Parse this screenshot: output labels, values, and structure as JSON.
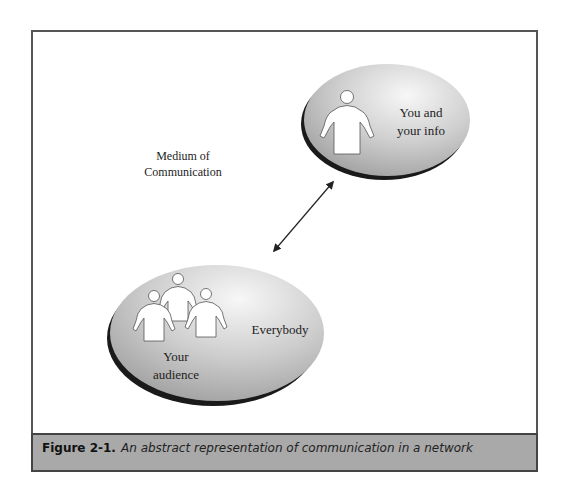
{
  "figure": {
    "number": "Figure 2-1.",
    "caption": "An abstract representation of communication in a network"
  },
  "nodes": {
    "self": {
      "line1": "You and",
      "line2": "your info",
      "icon": "person-icon"
    },
    "audience": {
      "group_label_line1": "Your",
      "group_label_line2": "audience",
      "side_label": "Everybody",
      "icon": "group-of-people-icon"
    }
  },
  "medium": {
    "line1": "Medium of",
    "line2": "Communication"
  },
  "connector": {
    "type": "bidirectional-arrow"
  },
  "colors": {
    "ellipse_fill_light": "#eeeeee",
    "ellipse_fill_dark": "#a8a8a8",
    "ellipse_shadow": "#1a1a1a",
    "caption_band": "#a9a9a9",
    "frame_border": "#555555"
  }
}
